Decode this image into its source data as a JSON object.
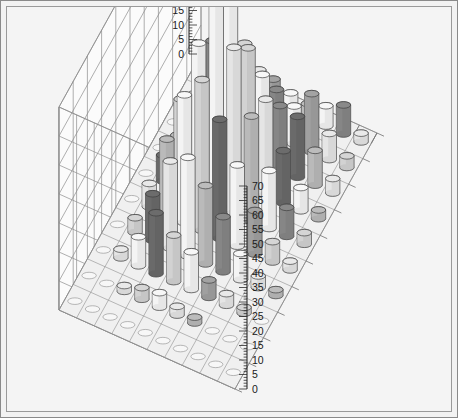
{
  "chart": {
    "title": "",
    "kind": "3d-cylinder-bar",
    "background_color": "#f4f4f4",
    "border_color": "#8a8a8a",
    "grid_line_color": "#8d8d8d",
    "wall_color": "#fbfbfb",
    "floor_color": "#f0f0f0"
  },
  "axes": {
    "left": {
      "name": "left-z-axis",
      "min": 0,
      "max": 70,
      "step": 5,
      "minor_step": 1,
      "ticks": [
        "0",
        "5",
        "10",
        "15",
        "20",
        "25",
        "30",
        "35",
        "40",
        "45",
        "50",
        "55",
        "60",
        "65",
        "70"
      ]
    },
    "right": {
      "name": "right-z-axis",
      "min": 0,
      "max": 70,
      "step": 5,
      "minor_step": 1,
      "ticks": [
        "0",
        "5",
        "10",
        "15",
        "20",
        "25",
        "30",
        "35",
        "40",
        "45",
        "50",
        "55",
        "60",
        "65",
        "70"
      ]
    },
    "x": {
      "name": "row-axis",
      "categories_count": 11
    },
    "y": {
      "name": "column-axis",
      "categories_count": 11
    }
  },
  "chart_data": {
    "type": "bar",
    "title": "",
    "xlabel": "",
    "ylabel": "",
    "zlabel": "",
    "zlim": [
      0,
      70
    ],
    "grid": true,
    "legend": "none",
    "rows": 11,
    "cols": 11,
    "x": [
      1,
      2,
      3,
      4,
      5,
      6,
      7,
      8,
      9,
      10,
      11
    ],
    "y": [
      1,
      2,
      3,
      4,
      5,
      6,
      7,
      8,
      9,
      10,
      11
    ],
    "palette": [
      "#ffffff",
      "#f0f0f0",
      "#dcdcdc",
      "#c2c2c2",
      "#a8a8a8",
      "#8d8d8d",
      "#6f6f6f",
      "#575757"
    ],
    "values": [
      [
        0,
        0,
        0,
        0,
        0,
        0,
        0,
        0,
        0,
        0,
        0
      ],
      [
        0,
        0,
        2,
        4,
        5,
        3,
        2,
        0,
        0,
        0,
        0
      ],
      [
        0,
        3,
        10,
        21,
        16,
        13,
        6,
        4,
        2,
        0,
        0
      ],
      [
        0,
        5,
        16,
        30,
        34,
        27,
        19,
        9,
        4,
        2,
        0
      ],
      [
        0,
        8,
        26,
        44,
        52,
        41,
        28,
        15,
        7,
        3,
        0
      ],
      [
        0,
        9,
        31,
        53,
        70,
        57,
        36,
        20,
        10,
        4,
        0
      ],
      [
        0,
        7,
        24,
        45,
        62,
        48,
        33,
        18,
        8,
        3,
        0
      ],
      [
        0,
        5,
        17,
        29,
        38,
        30,
        22,
        21,
        12,
        5,
        0
      ],
      [
        0,
        3,
        9,
        17,
        20,
        16,
        13,
        20,
        9,
        4,
        0
      ],
      [
        0,
        1,
        4,
        7,
        8,
        6,
        5,
        7,
        10,
        3,
        0
      ],
      [
        0,
        0,
        0,
        2,
        3,
        2,
        1,
        2,
        2,
        0,
        0
      ]
    ],
    "shades": [
      [
        0,
        0,
        0,
        0,
        0,
        0,
        0,
        0,
        0,
        0,
        0
      ],
      [
        0,
        0,
        1,
        2,
        0,
        1,
        3,
        0,
        0,
        0,
        0
      ],
      [
        0,
        1,
        0,
        6,
        2,
        0,
        4,
        1,
        2,
        0,
        0
      ],
      [
        0,
        2,
        6,
        1,
        0,
        3,
        5,
        0,
        1,
        3,
        0
      ],
      [
        0,
        1,
        3,
        0,
        2,
        6,
        0,
        4,
        2,
        1,
        0
      ],
      [
        0,
        6,
        2,
        0,
        0,
        1,
        3,
        0,
        5,
        2,
        0
      ],
      [
        0,
        3,
        0,
        5,
        0,
        2,
        1,
        6,
        0,
        3,
        0
      ],
      [
        0,
        1,
        4,
        6,
        2,
        0,
        5,
        6,
        3,
        1,
        0
      ],
      [
        0,
        2,
        0,
        3,
        1,
        5,
        0,
        4,
        1,
        2,
        0
      ],
      [
        0,
        0,
        2,
        1,
        4,
        0,
        3,
        0,
        5,
        1,
        0
      ],
      [
        0,
        0,
        0,
        3,
        1,
        0,
        2,
        0,
        1,
        0,
        0
      ]
    ]
  },
  "geometry": {
    "origin_x": 58,
    "origin_y": 308,
    "back_corner_x": 210,
    "back_corner_y": 22,
    "right_corner_x": 403,
    "right_corner_y": 290,
    "front_corner_x": 248,
    "front_corner_y": 378,
    "z_pixels_per_unit": 2.93
  }
}
